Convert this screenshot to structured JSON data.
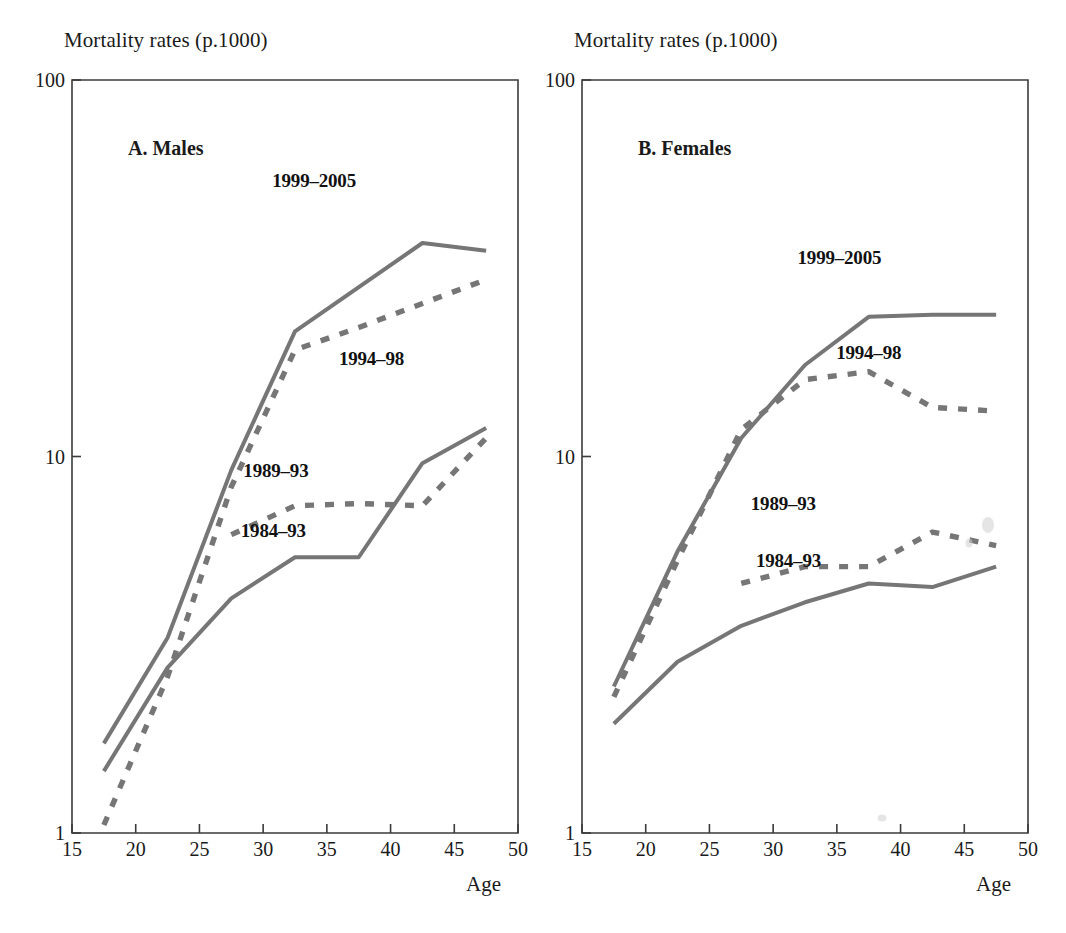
{
  "figure": {
    "xaxis_name": "Age",
    "yaxis_title": "Mortality rates (p.1000)"
  },
  "panels": [
    {
      "id": "males",
      "title": "A. Males"
    },
    {
      "id": "females",
      "title": "B. Females"
    }
  ],
  "chart_data": [
    {
      "type": "line",
      "title": "A. Males",
      "xlabel": "Age",
      "ylabel": "Mortality rates (p.1000)",
      "yscale": "log",
      "ylim": [
        1,
        100
      ],
      "xlim": [
        15,
        50
      ],
      "xticks": [
        15,
        20,
        25,
        30,
        35,
        40,
        45,
        50
      ],
      "yticks": [
        1,
        10,
        100
      ],
      "ytick_labels": [
        "1",
        "10",
        "100"
      ],
      "grid": false,
      "legend": "inline-annotations",
      "series": [
        {
          "name": "1999-2005",
          "style": "solid",
          "x": [
            17.5,
            22.5,
            27.5,
            32.5,
            42.5,
            47.5
          ],
          "values": [
            1.73,
            3.3,
            9.2,
            21.5,
            36.9,
            35.2
          ]
        },
        {
          "name": "1994-98",
          "style": "dashed",
          "x": [
            17.5,
            22.5,
            27.5,
            32.5,
            37.5,
            42.5,
            47.5
          ],
          "values": [
            1.05,
            2.6,
            8.3,
            19.2,
            22.0,
            25.5,
            29.5
          ]
        },
        {
          "name": "1989-93",
          "style": "dashed",
          "x": [
            27.5,
            32.5,
            37.5,
            42.5,
            47.5
          ],
          "values": [
            6.2,
            7.4,
            7.5,
            7.4,
            11.2
          ]
        },
        {
          "name": "1984-93",
          "style": "solid",
          "x": [
            17.5,
            22.5,
            27.5,
            32.5,
            37.5,
            42.5,
            47.5
          ],
          "values": [
            1.46,
            2.75,
            4.2,
            5.4,
            5.4,
            9.6,
            11.9
          ]
        }
      ],
      "annotations": [
        {
          "text": "1999–2005",
          "x": 34.0,
          "y": 52.0
        },
        {
          "text": "1994–98",
          "x": 38.5,
          "y": 17.5
        },
        {
          "text": "1989–93",
          "x": 31.0,
          "y": 8.8
        },
        {
          "text": "1984–93",
          "x": 30.8,
          "y": 6.1
        }
      ]
    },
    {
      "type": "line",
      "title": "B. Females",
      "xlabel": "Age",
      "ylabel": "Mortality rates (p.1000)",
      "yscale": "log",
      "ylim": [
        1,
        100
      ],
      "xlim": [
        15,
        50
      ],
      "xticks": [
        15,
        20,
        25,
        30,
        35,
        40,
        45,
        50
      ],
      "yticks": [
        1,
        10,
        100
      ],
      "ytick_labels": [
        "1",
        "10",
        "100"
      ],
      "grid": false,
      "legend": "inline-annotations",
      "series": [
        {
          "name": "1999-2005",
          "style": "solid",
          "x": [
            17.5,
            22.5,
            27.5,
            32.5,
            37.5,
            42.5,
            47.5
          ],
          "values": [
            2.45,
            5.6,
            11.2,
            17.5,
            23.5,
            23.8,
            23.8
          ]
        },
        {
          "name": "1994-98",
          "style": "dashed",
          "x": [
            17.5,
            22.5,
            27.5,
            32.5,
            37.5,
            42.5,
            47.5
          ],
          "values": [
            2.3,
            5.3,
            11.8,
            16.0,
            16.8,
            13.5,
            13.2
          ]
        },
        {
          "name": "1989-93",
          "style": "dashed",
          "x": [
            27.5,
            32.5,
            37.5,
            42.5,
            47.5
          ],
          "values": [
            4.6,
            5.1,
            5.1,
            6.3,
            5.8
          ]
        },
        {
          "name": "1984-93",
          "style": "solid",
          "x": [
            17.5,
            22.5,
            27.5,
            32.5,
            37.5,
            42.5,
            47.5
          ],
          "values": [
            1.95,
            2.85,
            3.55,
            4.1,
            4.6,
            4.5,
            5.1
          ]
        }
      ],
      "annotations": [
        {
          "text": "1999–2005",
          "x": 35.2,
          "y": 32.5
        },
        {
          "text": "1994–98",
          "x": 37.5,
          "y": 18.2
        },
        {
          "text": "1989–93",
          "x": 30.8,
          "y": 7.2
        },
        {
          "text": "1984–93",
          "x": 31.2,
          "y": 5.1
        }
      ]
    }
  ]
}
